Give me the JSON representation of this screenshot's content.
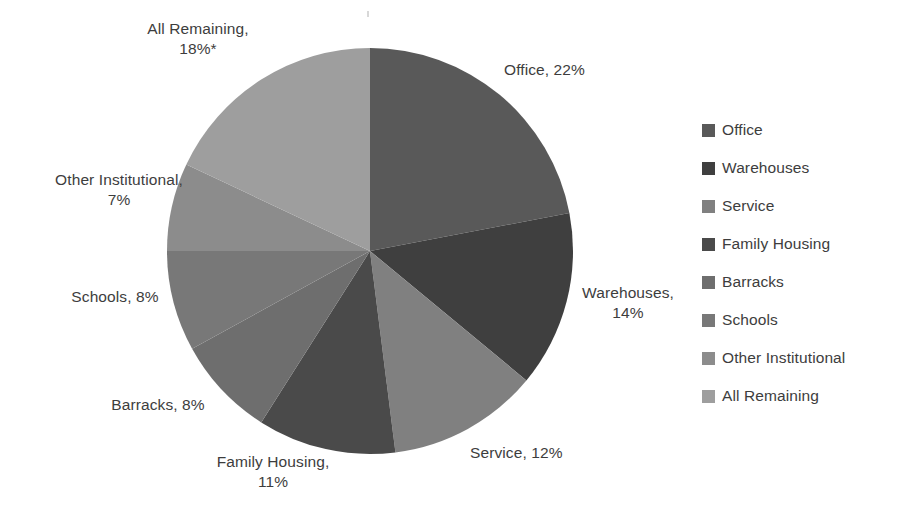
{
  "chart_data": {
    "type": "pie",
    "title": "",
    "subtitle": "",
    "xlabel": "",
    "ylabel": "",
    "grid": false,
    "legend_position": "right",
    "start_angle_deg": 0,
    "direction": "clockwise",
    "footnote_marker": "*",
    "units": "percent",
    "categories": [
      "Office",
      "Warehouses",
      "Service",
      "Family Housing",
      "Barracks",
      "Schools",
      "Other Institutional",
      "All Remaining"
    ],
    "values": [
      22,
      14,
      12,
      11,
      8,
      8,
      7,
      18
    ],
    "colors": [
      "#595959",
      "#3f3f3f",
      "#808080",
      "#4a4a4a",
      "#6e6e6e",
      "#787878",
      "#8c8c8c",
      "#9e9e9e"
    ],
    "slices": [
      {
        "name": "Office",
        "value": 22,
        "color": "#595959",
        "data_label": "Office, 22%"
      },
      {
        "name": "Warehouses",
        "value": 14,
        "color": "#3f3f3f",
        "data_label": "Warehouses,\n14%"
      },
      {
        "name": "Service",
        "value": 12,
        "color": "#808080",
        "data_label": "Service, 12%"
      },
      {
        "name": "Family Housing",
        "value": 11,
        "color": "#4a4a4a",
        "data_label": "Family Housing,\n11%"
      },
      {
        "name": "Barracks",
        "value": 8,
        "color": "#6e6e6e",
        "data_label": "Barracks, 8%"
      },
      {
        "name": "Schools",
        "value": 8,
        "color": "#787878",
        "data_label": "Schools, 8%"
      },
      {
        "name": "Other Institutional",
        "value": 7,
        "color": "#8c8c8c",
        "data_label": "Other Institutional,\n7%"
      },
      {
        "name": "All Remaining",
        "value": 18,
        "color": "#9e9e9e",
        "data_label": "All Remaining,\n18%*"
      }
    ]
  },
  "labels": {
    "office": "Office, 22%",
    "warehouses": "Warehouses,\n14%",
    "service": "Service, 12%",
    "family_housing": "Family Housing,\n11%",
    "barracks": "Barracks, 8%",
    "schools": "Schools, 8%",
    "other_institutional": "Other Institutional,\n7%",
    "all_remaining": "All Remaining,\n18%*"
  },
  "legend": {
    "items": [
      {
        "label": "Office",
        "color": "#595959"
      },
      {
        "label": "Warehouses",
        "color": "#3f3f3f"
      },
      {
        "label": "Service",
        "color": "#808080"
      },
      {
        "label": "Family Housing",
        "color": "#4a4a4a"
      },
      {
        "label": "Barracks",
        "color": "#6e6e6e"
      },
      {
        "label": "Schools",
        "color": "#787878"
      },
      {
        "label": "Other Institutional",
        "color": "#8c8c8c"
      },
      {
        "label": "All Remaining",
        "color": "#9e9e9e"
      }
    ]
  },
  "geometry": {
    "center_x": 370,
    "center_y": 251,
    "radius": 203
  }
}
